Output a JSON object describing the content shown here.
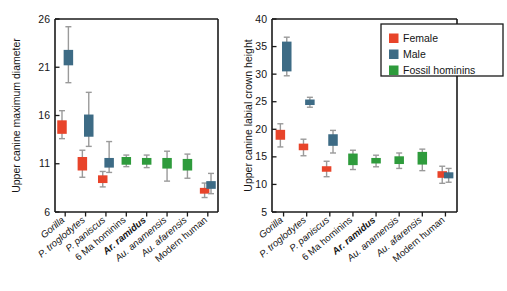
{
  "figure": {
    "background": "#ffffff",
    "colors": {
      "female": "#e8442a",
      "male": "#3d6b85",
      "fossil": "#2e9b3c",
      "whisker": "#9a9a9a",
      "axis": "#1a1a1a"
    }
  },
  "legend": {
    "position": "top-right-of-right-panel",
    "entries": [
      {
        "label": "Female",
        "color": "#e8442a"
      },
      {
        "label": "Male",
        "color": "#3d6b85"
      },
      {
        "label": "Fossil hominins",
        "color": "#2e9b3c"
      }
    ]
  },
  "chart_data": [
    {
      "type": "bar",
      "panel": "left",
      "title": "",
      "xlabel": "",
      "ylabel": "Upper canine maximum diameter",
      "ylim": [
        6,
        26
      ],
      "yticks": [
        6,
        11,
        16,
        21,
        26
      ],
      "ytick_labels": [
        "6",
        "11",
        "16",
        "21",
        "26"
      ],
      "grid": false,
      "categories": [
        "Gorilla",
        "P. troglodytes",
        "P. paniscus",
        "6 Ma hominins",
        "Ar. ramidus",
        "Au. anamensis",
        "Au. afarensis",
        "Modern human"
      ],
      "category_styles": [
        "italic",
        "italic",
        "italic",
        "plain",
        "bolditalic",
        "italic",
        "italic",
        "plain"
      ],
      "series": [
        {
          "name": "Female",
          "color": "#e8442a",
          "boxes": [
            {
              "category": "Gorilla",
              "low": 13.6,
              "q1": 14.1,
              "median": 14.8,
              "q3": 15.5,
              "high": 16.5
            },
            {
              "category": "P. troglodytes",
              "low": 9.6,
              "q1": 10.3,
              "median": 11.0,
              "q3": 11.7,
              "high": 12.4
            },
            {
              "category": "P. paniscus",
              "low": 8.6,
              "q1": 9.0,
              "median": 9.4,
              "q3": 9.8,
              "high": 10.2
            },
            {
              "category": "6 Ma hominins",
              "low": null,
              "q1": null,
              "median": null,
              "q3": null,
              "high": null
            },
            {
              "category": "Ar. ramidus",
              "low": null,
              "q1": null,
              "median": null,
              "q3": null,
              "high": null
            },
            {
              "category": "Au. anamensis",
              "low": null,
              "q1": null,
              "median": null,
              "q3": null,
              "high": null
            },
            {
              "category": "Au. afarensis",
              "low": null,
              "q1": null,
              "median": null,
              "q3": null,
              "high": null
            },
            {
              "category": "Modern human",
              "low": 7.5,
              "q1": 7.9,
              "median": 8.2,
              "q3": 8.5,
              "high": 9.0
            }
          ]
        },
        {
          "name": "Male",
          "color": "#3d6b85",
          "boxes": [
            {
              "category": "Gorilla",
              "low": 19.4,
              "q1": 21.2,
              "median": 22.0,
              "q3": 22.8,
              "high": 25.2
            },
            {
              "category": "P. troglodytes",
              "low": 12.8,
              "q1": 13.8,
              "median": 15.0,
              "q3": 16.1,
              "high": 18.4
            },
            {
              "category": "P. paniscus",
              "low": 10.1,
              "q1": 10.6,
              "median": 11.1,
              "q3": 11.6,
              "high": 13.3
            },
            {
              "category": "6 Ma hominins",
              "low": null,
              "q1": null,
              "median": null,
              "q3": null,
              "high": null
            },
            {
              "category": "Ar. ramidus",
              "low": null,
              "q1": null,
              "median": null,
              "q3": null,
              "high": null
            },
            {
              "category": "Au. anamensis",
              "low": null,
              "q1": null,
              "median": null,
              "q3": null,
              "high": null
            },
            {
              "category": "Au. afarensis",
              "low": null,
              "q1": null,
              "median": null,
              "q3": null,
              "high": null
            },
            {
              "category": "Modern human",
              "low": 7.9,
              "q1": 8.4,
              "median": 8.8,
              "q3": 9.2,
              "high": 10.0
            }
          ]
        },
        {
          "name": "Fossil hominins",
          "color": "#2e9b3c",
          "boxes": [
            {
              "category": "Gorilla",
              "low": null,
              "q1": null,
              "median": null,
              "q3": null,
              "high": null
            },
            {
              "category": "P. troglodytes",
              "low": null,
              "q1": null,
              "median": null,
              "q3": null,
              "high": null
            },
            {
              "category": "P. paniscus",
              "low": null,
              "q1": null,
              "median": null,
              "q3": null,
              "high": null
            },
            {
              "category": "6 Ma hominins",
              "low": 10.7,
              "q1": 10.9,
              "median": 11.3,
              "q3": 11.7,
              "high": 11.9
            },
            {
              "category": "Ar. ramidus",
              "low": 10.6,
              "q1": 10.9,
              "median": 11.2,
              "q3": 11.6,
              "high": 11.9
            },
            {
              "category": "Au. anamensis",
              "low": 9.2,
              "q1": 10.5,
              "median": 11.0,
              "q3": 11.6,
              "high": 12.3
            },
            {
              "category": "Au. afarensis",
              "low": 9.5,
              "q1": 10.3,
              "median": 10.9,
              "q3": 11.5,
              "high": 12.0
            },
            {
              "category": "Modern human",
              "low": null,
              "q1": null,
              "median": null,
              "q3": null,
              "high": null
            }
          ]
        }
      ]
    },
    {
      "type": "bar",
      "panel": "right",
      "title": "",
      "xlabel": "",
      "ylabel": "Upper canine labial crown height",
      "ylim": [
        5,
        40
      ],
      "yticks": [
        5,
        10,
        15,
        20,
        25,
        30,
        35,
        40
      ],
      "ytick_labels": [
        "5",
        "10",
        "15",
        "20",
        "25",
        "30",
        "35",
        "40"
      ],
      "grid": false,
      "categories": [
        "Gorilla",
        "P. troglodytes",
        "P. paniscus",
        "6 Ma hominins",
        "Ar. ramidus",
        "Au. anamensis",
        "Au. afarensis",
        "Modern human"
      ],
      "category_styles": [
        "italic",
        "italic",
        "italic",
        "plain",
        "bolditalic",
        "italic",
        "italic",
        "plain"
      ],
      "series": [
        {
          "name": "Female",
          "color": "#e8442a",
          "boxes": [
            {
              "category": "Gorilla",
              "low": 16.8,
              "q1": 18.1,
              "median": 19.0,
              "q3": 19.9,
              "high": 21.0
            },
            {
              "category": "P. troglodytes",
              "low": 15.2,
              "q1": 16.2,
              "median": 16.8,
              "q3": 17.4,
              "high": 18.2
            },
            {
              "category": "P. paniscus",
              "low": 11.4,
              "q1": 12.3,
              "median": 12.8,
              "q3": 13.3,
              "high": 14.2
            },
            {
              "category": "6 Ma hominins",
              "low": null,
              "q1": null,
              "median": null,
              "q3": null,
              "high": null
            },
            {
              "category": "Ar. ramidus",
              "low": null,
              "q1": null,
              "median": null,
              "q3": null,
              "high": null
            },
            {
              "category": "Au. anamensis",
              "low": null,
              "q1": null,
              "median": null,
              "q3": null,
              "high": null
            },
            {
              "category": "Au. afarensis",
              "low": null,
              "q1": null,
              "median": null,
              "q3": null,
              "high": null
            },
            {
              "category": "Modern human",
              "low": 10.2,
              "q1": 11.2,
              "median": 11.8,
              "q3": 12.4,
              "high": 13.3
            }
          ]
        },
        {
          "name": "Male",
          "color": "#3d6b85",
          "boxes": [
            {
              "category": "Gorilla",
              "low": 29.7,
              "q1": 30.5,
              "median": 33.2,
              "q3": 35.9,
              "high": 36.7
            },
            {
              "category": "P. troglodytes",
              "low": 24.0,
              "q1": 24.4,
              "median": 24.9,
              "q3": 25.4,
              "high": 25.8
            },
            {
              "category": "P. paniscus",
              "low": 15.7,
              "q1": 17.0,
              "median": 18.0,
              "q3": 19.1,
              "high": 19.8
            },
            {
              "category": "6 Ma hominins",
              "low": null,
              "q1": null,
              "median": null,
              "q3": null,
              "high": null
            },
            {
              "category": "Ar. ramidus",
              "low": null,
              "q1": null,
              "median": null,
              "q3": null,
              "high": null
            },
            {
              "category": "Au. anamensis",
              "low": null,
              "q1": null,
              "median": null,
              "q3": null,
              "high": null
            },
            {
              "category": "Au. afarensis",
              "low": null,
              "q1": null,
              "median": null,
              "q3": null,
              "high": null
            },
            {
              "category": "Modern human",
              "low": 10.4,
              "q1": 11.1,
              "median": 11.6,
              "q3": 12.2,
              "high": 12.9
            }
          ]
        },
        {
          "name": "Fossil hominins",
          "color": "#2e9b3c",
          "boxes": [
            {
              "category": "Gorilla",
              "low": null,
              "q1": null,
              "median": null,
              "q3": null,
              "high": null
            },
            {
              "category": "P. troglodytes",
              "low": null,
              "q1": null,
              "median": null,
              "q3": null,
              "high": null
            },
            {
              "category": "P. paniscus",
              "low": null,
              "q1": null,
              "median": null,
              "q3": null,
              "high": null
            },
            {
              "category": "6 Ma hominins",
              "low": 12.7,
              "q1": 13.5,
              "median": 14.5,
              "q3": 15.6,
              "high": 16.2
            },
            {
              "category": "Ar. ramidus",
              "low": 13.2,
              "q1": 13.8,
              "median": 14.3,
              "q3": 14.8,
              "high": 15.3
            },
            {
              "category": "Au. anamensis",
              "low": 12.9,
              "q1": 13.7,
              "median": 14.4,
              "q3": 15.1,
              "high": 15.7
            },
            {
              "category": "Au. afarensis",
              "low": 12.5,
              "q1": 13.6,
              "median": 14.7,
              "q3": 15.9,
              "high": 16.4
            },
            {
              "category": "Modern human",
              "low": null,
              "q1": null,
              "median": null,
              "q3": null,
              "high": null
            }
          ]
        }
      ]
    }
  ]
}
